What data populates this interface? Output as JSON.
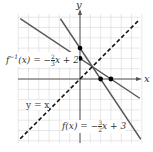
{
  "chart_data": {
    "type": "line",
    "title": "",
    "xlabel": "x",
    "ylabel": "y",
    "xlim": [
      -6,
      6
    ],
    "ylim": [
      -6,
      6
    ],
    "grid": true,
    "series": [
      {
        "name": "f(x) = -3/2 x + 3",
        "slope": -1.5,
        "intercept": 3,
        "style": "solid",
        "color": "#444444"
      },
      {
        "name": "f^-1(x) = -2/3 x + 2",
        "slope": -0.6667,
        "intercept": 2,
        "style": "solid",
        "color": "#444444"
      },
      {
        "name": "y = x",
        "slope": 1,
        "intercept": 0,
        "style": "dashed",
        "color": "#111111"
      }
    ],
    "points": [
      {
        "x": 0,
        "y": 3
      },
      {
        "x": 0,
        "y": 2
      },
      {
        "x": 2,
        "y": 0
      },
      {
        "x": 3,
        "y": 0
      },
      {
        "x": 1.2,
        "y": 1.2
      }
    ],
    "annotations": [
      "f^{-1}(x) = -2/3 x + 2",
      "y = x",
      "f(x) = -3/2 x + 3"
    ]
  },
  "labels": {
    "x_axis": "x",
    "y_axis": "y",
    "finv_prefix": "f",
    "finv_sup": "−1",
    "finv_rest": "(x) = −",
    "finv_num": "2",
    "finv_den": "3",
    "finv_tail": "x + 2",
    "yx": "y = x",
    "f_prefix": "f(x) = −",
    "f_num": "3",
    "f_den": "2",
    "f_tail": "x + 3"
  }
}
